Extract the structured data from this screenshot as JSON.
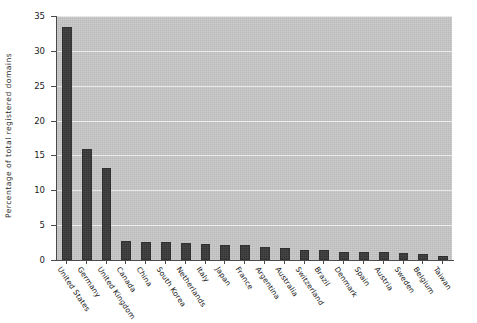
{
  "chart_data": {
    "type": "bar",
    "title": "",
    "subtitle": "",
    "xlabel": "",
    "ylabel": "Percentage of total registered domains",
    "ylim": [
      0,
      35
    ],
    "yticks": [
      0,
      5,
      10,
      15,
      20,
      25,
      30,
      35
    ],
    "ytick_labels": [
      "0",
      "5",
      "10",
      "15",
      "20",
      "25",
      "30",
      "35"
    ],
    "grid": true,
    "grid_axis": "y",
    "legend": null,
    "legend_position": "none",
    "plot_background_color": "#c8c8c8",
    "bar_color": "#3a3a3a",
    "gridline_color": "#f2f2f2",
    "axis_color": "#4a4a4a",
    "categories": [
      "United States",
      "Germany",
      "United Kingdom",
      "Canada",
      "China",
      "South Korea",
      "Netherlands",
      "Italy",
      "Japan",
      "France",
      "Argentina",
      "Australia",
      "Switzerland",
      "Brazil",
      "Denmark",
      "Spain",
      "Austria",
      "Sweden",
      "Belgium",
      "Taiwan"
    ],
    "values": [
      33.4,
      16.0,
      13.2,
      2.7,
      2.6,
      2.6,
      2.5,
      2.3,
      2.1,
      2.1,
      1.9,
      1.7,
      1.5,
      1.4,
      1.2,
      1.2,
      1.1,
      1.0,
      0.9,
      0.6
    ]
  }
}
